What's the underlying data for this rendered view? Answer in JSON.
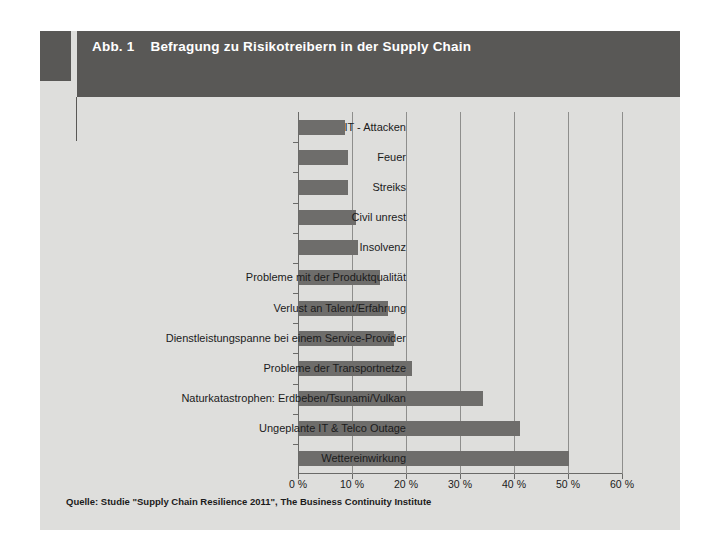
{
  "figure": {
    "number_label": "Abb. 1",
    "title": "Befragung zu Risikotreibern in der Supply Chain",
    "source_note": "Quelle: Studie \"Supply Chain Resilience 2011\", The Business Continuity Institute"
  },
  "colors": {
    "panel_background": "#dededc",
    "header_band": "#595856",
    "header_text": "#ffffff",
    "bar_fill": "#6e6d6b",
    "gridline": "#8e8e8c",
    "axis": "#6a6a68",
    "text": "#1b1b1b",
    "page_background": "#ffffff"
  },
  "chart_data": {
    "type": "bar",
    "orientation": "horizontal",
    "title": "Befragung zu Risikotreibern in der Supply Chain",
    "xlabel": "",
    "ylabel": "",
    "xlim": [
      0,
      60
    ],
    "grid": true,
    "legend": null,
    "categories": [
      "IT - Attacken",
      "Feuer",
      "Streiks",
      "Civil unrest",
      "Insolvenz",
      "Probleme mit der Produktqualität",
      "Verlust an Talent/Erfahrung",
      "Dienstleistungspanne bei einem Service-Provider",
      "Probleme der Transportnetze",
      "Naturkatastrophen: Erdbeben/Tsunami/Vulkan",
      "Ungeplante IT & Telco Outage",
      "Wettereinwirkung"
    ],
    "values": [
      8.5,
      9,
      9,
      10.5,
      11,
      15,
      16.5,
      17.5,
      21,
      34,
      41,
      50
    ],
    "xticks": [
      0,
      10,
      20,
      30,
      40,
      50,
      60
    ],
    "xtick_labels": [
      "0 %",
      "10 %",
      "20 %",
      "30 %",
      "40 %",
      "50 %",
      "60 %"
    ]
  }
}
